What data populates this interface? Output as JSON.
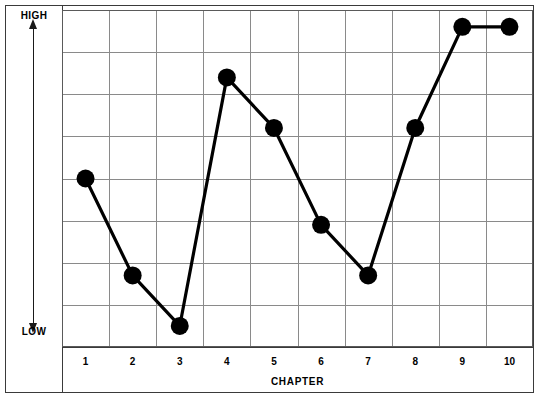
{
  "chart_data": {
    "type": "line",
    "title": "",
    "subtitle": "",
    "xlabel": "CHAPTER",
    "ylabel": "",
    "y_axis_top_label": "HIGH",
    "y_axis_bottom_label": "LOW",
    "categories": [
      "1",
      "2",
      "3",
      "4",
      "5",
      "6",
      "7",
      "8",
      "9",
      "10"
    ],
    "x": [
      1,
      2,
      3,
      4,
      5,
      6,
      7,
      8,
      9,
      10
    ],
    "values": [
      4.0,
      1.7,
      0.5,
      6.4,
      5.2,
      2.9,
      1.7,
      5.2,
      7.6,
      7.6
    ],
    "series": [
      {
        "name": "tension",
        "values": [
          4.0,
          1.7,
          0.5,
          6.4,
          5.2,
          2.9,
          1.7,
          5.2,
          7.6,
          7.6
        ]
      }
    ],
    "xlim": [
      0.5,
      10.5
    ],
    "ylim": [
      0,
      8
    ],
    "grid": true,
    "grid_rows": 8,
    "grid_cols": 10,
    "legend": "none",
    "marker": "filled-circle",
    "marker_size": 9,
    "line_color": "#000000",
    "marker_color": "#000000",
    "grid_color": "#8a8a8a",
    "frame_color": "#3a3a3a",
    "background": "#ffffff",
    "annotations": []
  },
  "axis": {
    "y": {
      "high_label": "HIGH",
      "low_label": "LOW",
      "arrow": "double-headed-vertical"
    },
    "x": {
      "title": "CHAPTER",
      "tick_labels": [
        "1",
        "2",
        "3",
        "4",
        "5",
        "6",
        "7",
        "8",
        "9",
        "10"
      ]
    }
  }
}
